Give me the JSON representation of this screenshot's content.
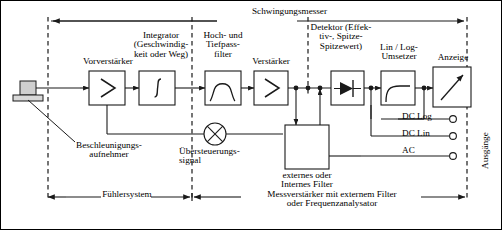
{
  "diagram": {
    "title": "Schwingungsmesser",
    "type": "block-diagram",
    "blocks": [
      {
        "id": "preamp",
        "label": "Vorverstärker",
        "symbol": "triangle-amplifier"
      },
      {
        "id": "integrator",
        "label": "Integrator\n(Geschwindig-\nkeit oder Weg)",
        "symbol": "integral-sign"
      },
      {
        "id": "filter",
        "label": "Hoch- und\nTiefpass-\nfilter",
        "symbol": "bandpass-curve"
      },
      {
        "id": "amp",
        "label": "Verstärker",
        "symbol": "triangle-amplifier"
      },
      {
        "id": "detector",
        "label": "Detektor (Effek-\ntiv-, Spitze-\nSpitzewert)",
        "symbol": "diode"
      },
      {
        "id": "converter",
        "label": "Lin / Log-\nUmsetzer",
        "symbol": "log-curve"
      },
      {
        "id": "display",
        "label": "Anzeige",
        "symbol": "meter-needle"
      },
      {
        "id": "extfilter",
        "label": "externes oder\nInternes Filter",
        "symbol": "empty-box"
      }
    ],
    "sensor": {
      "label": "Beschleunigungs-\naufnehmer",
      "symbol": "accelerometer"
    },
    "overload": {
      "label": "Übersteuerungs-\nsignal",
      "symbol": "crossed-circle-lamp"
    },
    "outputs": {
      "group_label": "Ausgänge",
      "terminals": [
        "DC Log",
        "DC Lin",
        "AC"
      ]
    },
    "brackets": [
      {
        "id": "sensor-system",
        "label": "Fühlersystem"
      },
      {
        "id": "measuring-amp",
        "label": "Messverstärker mit externem Filter\noder Frequenzanalysator"
      }
    ]
  },
  "colors": {
    "line": "#1a1a1a",
    "sensor_fill": "#cfcfcf",
    "background": "#ffffff"
  }
}
